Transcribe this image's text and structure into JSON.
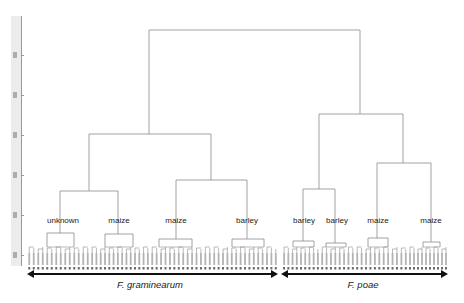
{
  "figure": {
    "type": "dendrogram",
    "clade_labels": [
      {
        "text": "unknown",
        "x": 63,
        "y": 217
      },
      {
        "text": "maize",
        "x": 119,
        "y": 217
      },
      {
        "text": "maize",
        "x": 176,
        "y": 217
      },
      {
        "text": "barley",
        "x": 247,
        "y": 217
      },
      {
        "text": "barley",
        "x": 304,
        "y": 217
      },
      {
        "text": "barley",
        "x": 337,
        "y": 217
      },
      {
        "text": "maize",
        "x": 378,
        "y": 217
      },
      {
        "text": "maize",
        "x": 431,
        "y": 217
      }
    ],
    "species_groups": [
      {
        "name": "F. graminearum",
        "x1": 27,
        "x2": 278,
        "label_x": 150
      },
      {
        "name": "F. poae",
        "x1": 281,
        "x2": 448,
        "label_x": 363
      }
    ],
    "tree": {
      "root": {
        "y": 30,
        "x1": 149,
        "x2": 360
      },
      "nodes": [
        {
          "id": "G",
          "y": 134,
          "x1": 89,
          "x2": 211,
          "parent_x": 149
        },
        {
          "id": "P",
          "y": 114,
          "x1": 319,
          "x2": 403,
          "parent_x": 360
        },
        {
          "id": "G1",
          "y": 191,
          "x1": 60,
          "x2": 118,
          "parent_x": 89
        },
        {
          "id": "G2",
          "y": 180,
          "x1": 176,
          "x2": 247,
          "parent_x": 211
        },
        {
          "id": "P1",
          "y": 189,
          "x1": 303,
          "x2": 335,
          "parent_x": 319
        },
        {
          "id": "P2",
          "y": 163,
          "x1": 377,
          "x2": 431,
          "parent_x": 403
        },
        {
          "id": "unknown",
          "y": 233,
          "x1": 47,
          "x2": 74,
          "parent_x": 60
        },
        {
          "id": "maize1",
          "y": 234,
          "x1": 105,
          "x2": 133,
          "parent_x": 118
        },
        {
          "id": "maize2",
          "y": 239,
          "x1": 159,
          "x2": 192,
          "parent_x": 176
        },
        {
          "id": "barley1",
          "y": 239,
          "x1": 232,
          "x2": 264,
          "parent_x": 247
        },
        {
          "id": "barley2",
          "y": 241,
          "x1": 293,
          "x2": 314,
          "parent_x": 303
        },
        {
          "id": "barley3",
          "y": 243,
          "x1": 326,
          "x2": 346,
          "parent_x": 335
        },
        {
          "id": "maize3",
          "y": 238,
          "x1": 368,
          "x2": 388,
          "parent_x": 377
        },
        {
          "id": "maize4",
          "y": 242,
          "x1": 423,
          "x2": 440,
          "parent_x": 431
        }
      ],
      "leaf_clusters": [
        {
          "x1": 27,
          "x2": 90,
          "n": 14,
          "parent": "unknown"
        },
        {
          "x1": 90,
          "x2": 150,
          "n": 14,
          "parent": "maize1"
        },
        {
          "x1": 150,
          "x2": 212,
          "n": 14,
          "parent": "maize2"
        },
        {
          "x1": 212,
          "x2": 278,
          "n": 15,
          "parent": "barley1"
        },
        {
          "x1": 282,
          "x2": 320,
          "n": 9,
          "parent": "barley2"
        },
        {
          "x1": 320,
          "x2": 355,
          "n": 8,
          "parent": "barley3"
        },
        {
          "x1": 355,
          "x2": 408,
          "n": 12,
          "parent": "maize3"
        },
        {
          "x1": 408,
          "x2": 448,
          "n": 10,
          "parent": "maize4"
        }
      ]
    },
    "y_axis": {
      "tick_positions": [
        55,
        95,
        135,
        175,
        215,
        255
      ]
    }
  }
}
